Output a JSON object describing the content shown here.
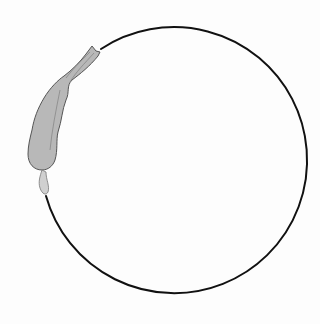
{
  "canvas": {
    "width": 320,
    "height": 324,
    "background": "#fdfdfd"
  },
  "circle": {
    "cx": 163,
    "cy": 162,
    "r": 133,
    "stroke": "#111111",
    "stroke_width": 2
  },
  "figure": {
    "label": "gray elongated shape along circle arc",
    "fill": "#b8b8b8",
    "stroke": "#555555"
  }
}
